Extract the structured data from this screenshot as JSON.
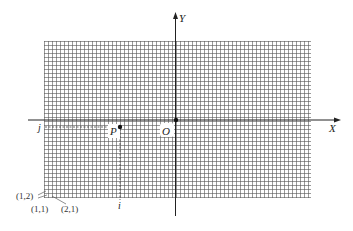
{
  "diagram": {
    "type": "image-coordinate-grid",
    "grid": {
      "x0": 44,
      "y0": 41,
      "x1": 311,
      "y1": 198,
      "cell": 4,
      "color": "#555555"
    },
    "axes": {
      "x_label": "X",
      "y_label": "Y",
      "color": "#333333"
    },
    "points": {
      "origin": {
        "label": "O",
        "x": 176,
        "y": 120
      },
      "p": {
        "label": "P",
        "x": 120,
        "y": 127
      }
    },
    "projections": {
      "row_label": "j",
      "col_label": "i"
    },
    "pixel_labels": {
      "a": "(1,2)",
      "b": "(1,1)",
      "c": "(2,1)"
    }
  }
}
